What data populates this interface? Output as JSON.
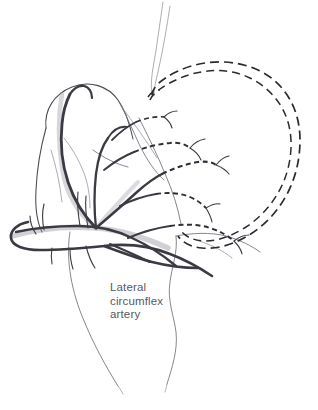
{
  "figure": {
    "background_color": "#ffffff",
    "width": 318,
    "height": 410,
    "style": "hand-drawn pencil medical illustration"
  },
  "labels": {
    "lateral_circumflex_artery": {
      "line1": "Lateral",
      "line2": "circumflex",
      "line3": "artery",
      "color": "#58585e",
      "x": 110,
      "y": 281
    }
  },
  "structures": {
    "greater_trochanter": "greater-trochanter",
    "femoral_head": "femoral-head-dashed-arc",
    "acetabulum": "acetabular-dashed-arc",
    "femoral_neck": "femoral-neck",
    "femoral_shaft": "femoral-shaft",
    "artery_trunk": "lateral-circumflex-artery-trunk",
    "ascending_branches": "ascending-retinacular-branches",
    "descending_branch": "descending-branch"
  },
  "colors": {
    "bone_outline": "#4b4b50",
    "bone_faint": "#70707a",
    "dashed_bone": "#2a2a30",
    "vessel": "#3a3a42",
    "vessel_shade": "#9a9aa2",
    "label_text": "#58585e"
  }
}
